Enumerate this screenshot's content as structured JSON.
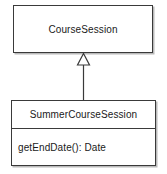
{
  "diagram": {
    "type": "uml-class-diagram",
    "background_color": "#ffffff",
    "line_color": "#3a3a3a",
    "text_color": "#1a1a1a",
    "classes": [
      {
        "id": "coursesession",
        "name": "CourseSession",
        "attributes": [],
        "operations": []
      },
      {
        "id": "summercoursesession",
        "name": "SummerCourseSession",
        "attributes": [],
        "operations": [
          "getEndDate(): Date"
        ]
      }
    ],
    "relationships": [
      {
        "kind": "generalization",
        "source": "SummerCourseSession",
        "target": "CourseSession",
        "arrow": "hollow-triangle"
      }
    ]
  }
}
